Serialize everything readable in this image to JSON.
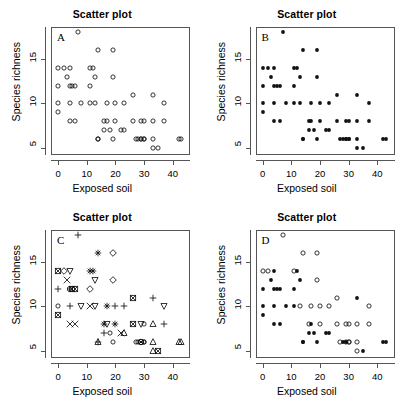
{
  "figure": {
    "panel_count": 4,
    "shared": {
      "title": "Scatter plot",
      "xlabel": "Exposed soil",
      "ylabel": "Species richness",
      "xticks": [
        0,
        10,
        20,
        30,
        40
      ],
      "yticks": [
        5,
        10,
        15
      ],
      "xlim": [
        -2.5,
        46
      ],
      "ylim": [
        4.2,
        18.6
      ],
      "grid": false,
      "axis_color": "#555555",
      "point_color": "#000000"
    }
  },
  "chart_data": [
    {
      "type": "scatter",
      "panel": "A",
      "title": "Scatter plot",
      "xlabel": "Exposed soil",
      "ylabel": "Species richness",
      "xlim": [
        -2.5,
        46
      ],
      "ylim": [
        4.2,
        18.6
      ],
      "xticks": [
        0,
        10,
        20,
        30,
        40
      ],
      "yticks": [
        5,
        10,
        15
      ],
      "grid": false,
      "marker": "open-circle",
      "x": [
        7,
        14,
        19,
        0,
        2,
        4,
        11,
        12,
        3,
        0,
        4,
        5,
        6,
        11,
        13,
        19,
        0,
        4,
        8,
        11,
        13,
        17,
        20,
        23,
        26,
        33,
        37,
        0,
        4,
        6,
        16,
        17,
        20,
        22,
        26,
        29,
        30,
        33,
        37,
        14,
        16,
        18,
        23,
        27,
        29,
        30,
        14,
        19,
        28,
        29,
        30,
        33,
        42,
        43,
        33,
        35
      ],
      "y": [
        18,
        16,
        16,
        14,
        14,
        14,
        14,
        14,
        13,
        12,
        12,
        12,
        12,
        12,
        13,
        13,
        10,
        10,
        10,
        10,
        10,
        10,
        10,
        10,
        11,
        11,
        10,
        9,
        8,
        8,
        8,
        8,
        8,
        7,
        8,
        8,
        8,
        8,
        8,
        6,
        7,
        7,
        7,
        6,
        6,
        6,
        6,
        6,
        6,
        6,
        6,
        6,
        6,
        6,
        5,
        5
      ]
    },
    {
      "type": "scatter",
      "panel": "B",
      "title": "Scatter plot",
      "xlabel": "Exposed soil",
      "ylabel": "Species richness",
      "xlim": [
        -2.5,
        46
      ],
      "ylim": [
        4.2,
        18.6
      ],
      "xticks": [
        0,
        10,
        20,
        30,
        40
      ],
      "yticks": [
        5,
        10,
        15
      ],
      "grid": false,
      "marker": "filled-circle",
      "x": [
        7,
        14,
        19,
        0,
        2,
        4,
        11,
        12,
        3,
        0,
        4,
        5,
        6,
        11,
        13,
        19,
        0,
        4,
        8,
        11,
        13,
        17,
        20,
        23,
        26,
        33,
        37,
        0,
        4,
        6,
        16,
        17,
        20,
        22,
        26,
        29,
        30,
        33,
        37,
        14,
        16,
        18,
        23,
        27,
        29,
        30,
        14,
        19,
        28,
        29,
        30,
        33,
        42,
        43,
        33,
        35
      ],
      "y": [
        18,
        16,
        16,
        14,
        14,
        14,
        14,
        14,
        13,
        12,
        12,
        12,
        12,
        12,
        13,
        13,
        10,
        10,
        10,
        10,
        10,
        10,
        10,
        10,
        11,
        11,
        10,
        9,
        8,
        8,
        8,
        8,
        8,
        7,
        8,
        8,
        8,
        8,
        8,
        6,
        7,
        7,
        7,
        6,
        6,
        6,
        6,
        6,
        6,
        6,
        6,
        6,
        6,
        6,
        5,
        5
      ]
    },
    {
      "type": "scatter",
      "panel": "C",
      "title": "Scatter plot",
      "xlabel": "Exposed soil",
      "ylabel": "Species richness",
      "xlim": [
        -2.5,
        46
      ],
      "ylim": [
        4.2,
        18.6
      ],
      "xticks": [
        0,
        10,
        20,
        30,
        40
      ],
      "yticks": [
        5,
        10,
        15
      ],
      "grid": false,
      "marker": "varied-symbols",
      "symbol_set": [
        "plus",
        "asterisk",
        "diamond",
        "triangle-down",
        "triangle-up",
        "cross",
        "square-x",
        "open-circle",
        "circle-plus",
        "circle-x",
        "square"
      ],
      "x": [
        7,
        14,
        19,
        0,
        2,
        4,
        11,
        12,
        3,
        0,
        4,
        5,
        6,
        11,
        13,
        19,
        0,
        4,
        8,
        11,
        13,
        17,
        20,
        23,
        26,
        33,
        37,
        0,
        4,
        6,
        16,
        17,
        20,
        22,
        26,
        29,
        30,
        33,
        37,
        14,
        16,
        18,
        23,
        27,
        29,
        30,
        14,
        19,
        28,
        29,
        30,
        33,
        42,
        43,
        33,
        35
      ],
      "y": [
        18,
        16,
        16,
        14,
        14,
        14,
        14,
        14,
        13,
        12,
        12,
        12,
        12,
        12,
        13,
        13,
        10,
        10,
        10,
        10,
        10,
        10,
        10,
        10,
        11,
        11,
        10,
        9,
        8,
        8,
        8,
        8,
        8,
        7,
        8,
        8,
        8,
        8,
        8,
        6,
        7,
        7,
        7,
        6,
        6,
        6,
        6,
        6,
        6,
        6,
        6,
        6,
        6,
        6,
        5,
        5
      ],
      "symbols": [
        "plus",
        "asterisk",
        "diamond",
        "square-x",
        "diamond",
        "triangle-down",
        "asterisk",
        "asterisk",
        "cross",
        "plus",
        "circle-plus",
        "square-x",
        "square-x",
        "diamond",
        "triangle-down",
        "diamond",
        "open-circle",
        "plus",
        "triangle-down",
        "cross",
        "triangle-down",
        "asterisk",
        "plus",
        "plus",
        "square-x",
        "plus",
        "triangle-down",
        "square-x",
        "cross",
        "cross",
        "asterisk",
        "triangle-down",
        "asterisk",
        "cross",
        "square-x",
        "triangle-down",
        "open-circle",
        "triangle-up",
        "plus",
        "plus",
        "plus",
        "open-circle",
        "triangle-up",
        "open-circle",
        "circle-x",
        "open-circle",
        "triangle-up",
        "open-circle",
        "open-circle",
        "circle-x",
        "open-circle",
        "triangle-up",
        "triangle-up",
        "triangle-up",
        "triangle-up",
        "square-x"
      ]
    },
    {
      "type": "scatter",
      "panel": "D",
      "title": "Scatter plot",
      "xlabel": "Exposed soil",
      "ylabel": "Species richness",
      "xlim": [
        -2.5,
        46
      ],
      "ylim": [
        4.2,
        18.6
      ],
      "xticks": [
        0,
        10,
        20,
        30,
        40
      ],
      "yticks": [
        5,
        10,
        15
      ],
      "grid": false,
      "marker": "mixed-open-and-filled-circle",
      "x": [
        7,
        14,
        19,
        0,
        2,
        4,
        11,
        12,
        3,
        0,
        4,
        5,
        6,
        11,
        13,
        19,
        0,
        4,
        8,
        11,
        13,
        17,
        20,
        23,
        26,
        33,
        37,
        0,
        4,
        6,
        16,
        17,
        20,
        22,
        26,
        29,
        30,
        33,
        37,
        14,
        16,
        18,
        23,
        27,
        29,
        30,
        14,
        19,
        28,
        29,
        30,
        33,
        42,
        43,
        33,
        35
      ],
      "y": [
        18,
        16,
        16,
        14,
        14,
        14,
        14,
        14,
        13,
        12,
        12,
        12,
        12,
        12,
        13,
        13,
        10,
        10,
        10,
        10,
        10,
        10,
        10,
        10,
        11,
        11,
        10,
        9,
        8,
        8,
        8,
        8,
        8,
        7,
        8,
        8,
        8,
        8,
        8,
        6,
        7,
        7,
        7,
        6,
        6,
        6,
        6,
        6,
        6,
        6,
        6,
        6,
        6,
        6,
        5,
        5
      ],
      "filled": [
        false,
        false,
        false,
        false,
        false,
        true,
        false,
        true,
        true,
        true,
        true,
        true,
        true,
        true,
        true,
        false,
        true,
        true,
        true,
        true,
        false,
        false,
        false,
        false,
        false,
        true,
        false,
        true,
        true,
        true,
        false,
        true,
        false,
        true,
        false,
        false,
        false,
        false,
        false,
        true,
        true,
        true,
        true,
        false,
        true,
        false,
        true,
        true,
        true,
        false,
        false,
        false,
        true,
        true,
        false,
        true
      ]
    }
  ],
  "panels": [
    {
      "label": "A"
    },
    {
      "label": "B"
    },
    {
      "label": "C"
    },
    {
      "label": "D"
    }
  ]
}
